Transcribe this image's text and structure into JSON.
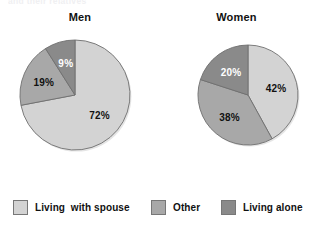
{
  "title_remnant": "and their relatives",
  "colors": {
    "light": "#d3d3d3",
    "medium": "#a8a8a8",
    "dark": "#8a8a8a",
    "outline": "#6f6f6f",
    "text": "#111111",
    "text_on_dark": "#ffffff",
    "background": "#ffffff"
  },
  "panels": {
    "men": {
      "title": "Men"
    },
    "women": {
      "title": "Women"
    }
  },
  "legend": {
    "items": [
      {
        "label": "Living  with spouse",
        "color": "#d3d3d3",
        "key": "living-with-spouse"
      },
      {
        "label": "Other",
        "color": "#a8a8a8",
        "key": "other"
      },
      {
        "label": "Living alone",
        "color": "#8a8a8a",
        "key": "living-alone"
      }
    ]
  },
  "labels": {
    "men": {
      "light": "72%",
      "medium": "19%",
      "dark": "9%"
    },
    "women": {
      "light": "42%",
      "medium": "38%",
      "dark": "20%"
    }
  },
  "chart_data": {
    "type": "pie",
    "title": "",
    "legend_position": "bottom",
    "categories": [
      "Living  with spouse",
      "Other",
      "Living alone"
    ],
    "category_colors": [
      "#d3d3d3",
      "#a8a8a8",
      "#8a8a8a"
    ],
    "units": "percent",
    "charts": [
      {
        "name": "Men",
        "labels": [
          "Living  with spouse",
          "Other",
          "Living alone"
        ],
        "values": [
          72,
          19,
          9
        ],
        "value_labels": [
          "72%",
          "19%",
          "9%"
        ],
        "start_angle_deg": 0,
        "direction": "clockwise-for-first-slice"
      },
      {
        "name": "Women",
        "labels": [
          "Living  with spouse",
          "Other",
          "Living alone"
        ],
        "values": [
          42,
          38,
          20
        ],
        "value_labels": [
          "42%",
          "38%",
          "20%"
        ],
        "start_angle_deg": 0,
        "direction": "clockwise-for-first-slice"
      }
    ]
  }
}
